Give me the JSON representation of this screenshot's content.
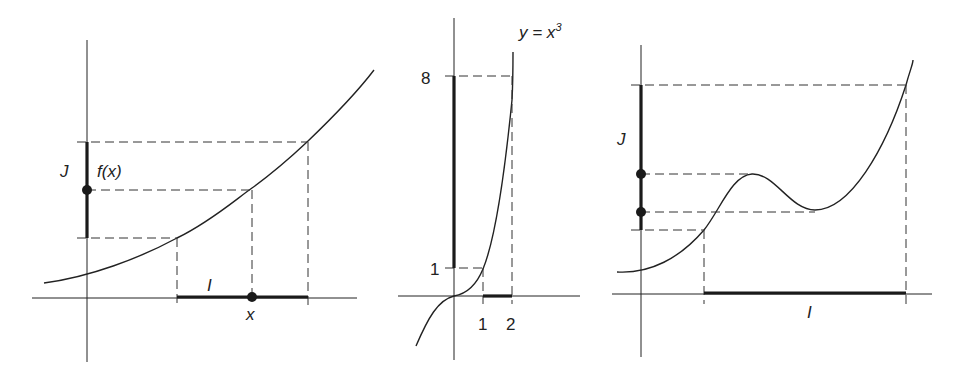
{
  "figure": {
    "panels": [
      {
        "id": "left",
        "description": "Increasing function f maps interval I onto interval J",
        "labels": {
          "J": "J",
          "fx": "f(x)",
          "I": "I",
          "x": "x"
        }
      },
      {
        "id": "middle",
        "description": "y = x^3 maps [1,2] onto [1,8]",
        "labels": {
          "curve": "y = x",
          "exponent": "3",
          "y_top": "8",
          "y_bottom": "1",
          "x_left": "1",
          "x_right": "2"
        }
      },
      {
        "id": "right",
        "description": "Non-monotone function maps interval I onto interval J",
        "labels": {
          "J": "J",
          "I": "I"
        }
      }
    ],
    "colors": {
      "ink": "#222222",
      "background": "#ffffff"
    }
  }
}
